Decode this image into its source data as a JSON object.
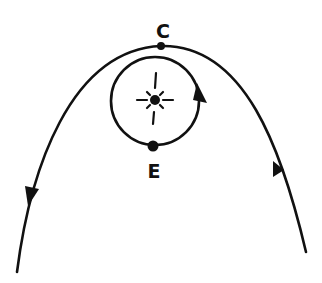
{
  "diagram": {
    "colors": {
      "ink": "#111111",
      "background": "#ffffff"
    },
    "labels": {
      "comet_point": "C",
      "earth_point": "E"
    },
    "elements": {
      "parabola": {
        "name": "comet-parabolic-orbit",
        "direction": "enters bottom-right, passes over C, exits bottom-left"
      },
      "circle": {
        "name": "earth-circular-orbit",
        "direction": "counterclockwise"
      },
      "center": {
        "name": "sun-icon"
      }
    }
  }
}
